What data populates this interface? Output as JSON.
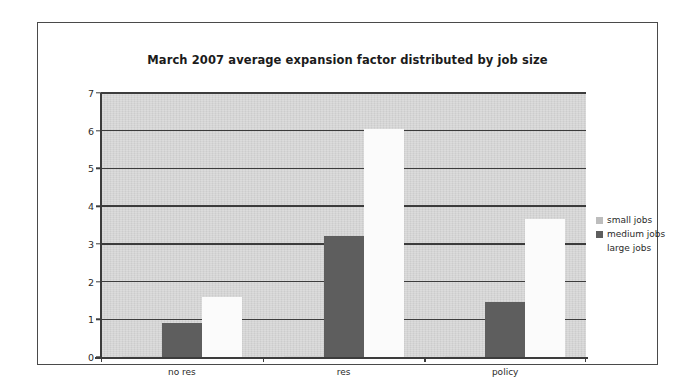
{
  "chart_data": {
    "type": "bar",
    "title": "March 2007 average expansion factor distributed by job size",
    "xlabel": "",
    "ylabel": "",
    "categories": [
      "no res",
      "res",
      "policy"
    ],
    "series": [
      {
        "name": "small jobs",
        "color": "#d0d0d0",
        "values": [
          0.02,
          0.02,
          0.02
        ]
      },
      {
        "name": "medium jobs",
        "color": "#5e5e5e",
        "values": [
          0.9,
          3.2,
          1.45
        ]
      },
      {
        "name": "large jobs",
        "color": "#fbfbfb",
        "values": [
          1.6,
          6.05,
          3.65
        ]
      }
    ],
    "ylim": [
      0,
      7
    ],
    "yticks": [
      0,
      1,
      2,
      3,
      4,
      5,
      6,
      7
    ],
    "ytick_labels": [
      "0",
      "1",
      "2",
      "3",
      "4",
      "5",
      "6",
      "7"
    ],
    "grid": true,
    "legend_position": "right",
    "plot_background": "#d3d3d3"
  },
  "legend": {
    "entries": [
      {
        "label": "small jobs"
      },
      {
        "label": "medium jobs"
      },
      {
        "label": "large jobs"
      }
    ]
  }
}
